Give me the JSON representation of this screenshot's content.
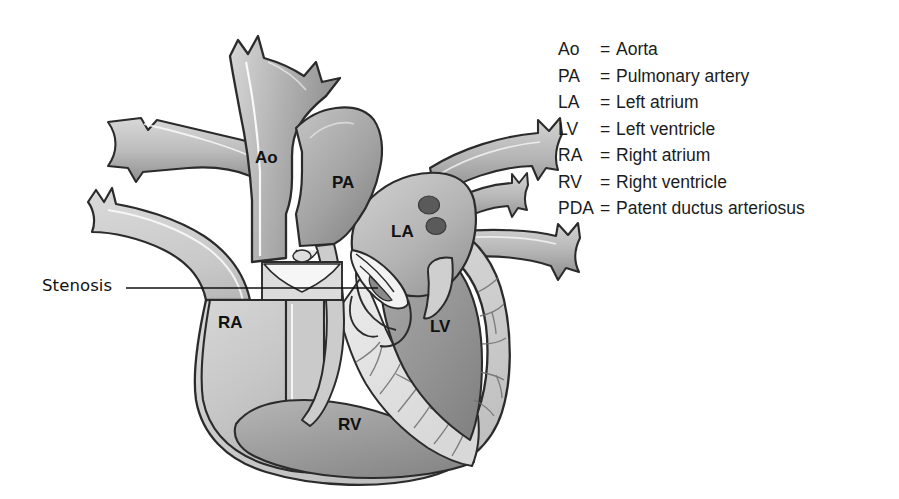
{
  "figure": {
    "background_color": "#ffffff"
  },
  "callout": {
    "label": "Stenosis",
    "leader_line": {
      "x1": 126,
      "y1": 288,
      "x2": 378,
      "y2": 288
    }
  },
  "anatomy_labels": [
    {
      "abbr": "Ao",
      "x": 255,
      "y": 163,
      "name": "aorta-label"
    },
    {
      "abbr": "PA",
      "x": 332,
      "y": 188,
      "name": "pulmonary-artery-label"
    },
    {
      "abbr": "LA",
      "x": 391,
      "y": 237,
      "name": "left-atrium-label"
    },
    {
      "abbr": "RA",
      "x": 218,
      "y": 328,
      "name": "right-atrium-label"
    },
    {
      "abbr": "LV",
      "x": 430,
      "y": 332,
      "name": "left-ventricle-label"
    },
    {
      "abbr": "RV",
      "x": 338,
      "y": 430,
      "name": "right-ventricle-label"
    }
  ],
  "legend": {
    "items": [
      {
        "abbr": "Ao",
        "eq": "=",
        "term": "Aorta"
      },
      {
        "abbr": "PA",
        "eq": "=",
        "term": "Pulmonary artery"
      },
      {
        "abbr": "LA",
        "eq": "=",
        "term": "Left atrium"
      },
      {
        "abbr": "LV",
        "eq": "=",
        "term": "Left ventricle"
      },
      {
        "abbr": "RA",
        "eq": "=",
        "term": "Right atrium"
      },
      {
        "abbr": "RV",
        "eq": "=",
        "term": "Right ventricle"
      },
      {
        "abbr": "PDA",
        "eq": "=",
        "term": "Patent ductus arteriosus"
      }
    ]
  },
  "colors": {
    "outline": "#2b2b2b",
    "myocardium_light": "#d2d2d2",
    "chamber_light": "#c6c6c6",
    "chamber_mid": "#b0b0b0",
    "chamber_dark": "#8f8f8f",
    "vessel_wall": "#b8b8b8",
    "valve_white": "#f2f2f2",
    "vein_opening_dark": "#5a5a5a",
    "trabeculae_light": "#e2e2e2",
    "text": "#1c1c1c"
  }
}
